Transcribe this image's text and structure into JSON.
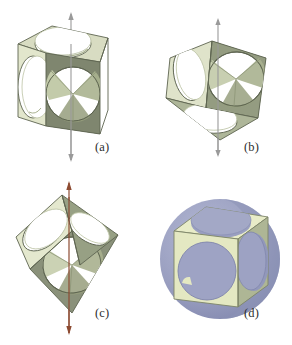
{
  "figure": {
    "caption_style": "lettered-panels",
    "background": "#ffffff",
    "panel_count": 4
  },
  "palette": {
    "face_top_light": "#d8dcc2",
    "face_left_light": "#e2e6cc",
    "face_front_dark": "#7f866f",
    "face_side_mid": "#9aa287",
    "interior_shadow": "#6e7561",
    "interior_light": "#c9cfb2",
    "edge_line": "#5d6450",
    "hole_white": "#ffffff",
    "axis_gray": "#9a9a9a",
    "axis_red": "#8d4b32",
    "sphere_blue": "#9a9fc0",
    "sphere_blue_dark": "#8086ad",
    "sphere_blue_light": "#aeb3cd",
    "label_text": "#2d2d2d"
  },
  "panels": [
    {
      "id": "a",
      "label": "(a)",
      "object": "cube-with-circular-holes",
      "orientation": "face-on / upright cube, standard three-quarter view",
      "axis": {
        "present": true,
        "type": "4-fold rotation axis",
        "color": "#9a9a9a",
        "direction": "vertical",
        "through": "centers of top and bottom faces",
        "arrows": "both-ends"
      },
      "visible_faces": [
        "top",
        "left",
        "front"
      ],
      "holes_visible": 4,
      "sphere_visible": false
    },
    {
      "id": "b",
      "label": "(b)",
      "object": "cube-with-circular-holes",
      "orientation": "tilted, rotated about a face axis",
      "axis": {
        "present": true,
        "type": "2-fold rotation axis",
        "color": "#9a9a9a",
        "direction": "vertical",
        "through": "midpoints of opposite edges",
        "arrows": "both-ends"
      },
      "visible_faces": [
        "top",
        "left",
        "front"
      ],
      "holes_visible": 4,
      "sphere_visible": false
    },
    {
      "id": "c",
      "label": "(c)",
      "object": "cube-with-circular-holes",
      "orientation": "standing on a vertex, diamond silhouette",
      "axis": {
        "present": true,
        "type": "3-fold rotation axis",
        "color": "#8d4b32",
        "direction": "vertical",
        "through": "opposite body-diagonal vertices",
        "arrows": "both-ends"
      },
      "visible_faces": [
        "upper-left",
        "upper-right",
        "lower-front"
      ],
      "holes_visible": 4,
      "sphere_visible": false
    },
    {
      "id": "d",
      "label": "(d)",
      "object": "cube-with-circular-holes-and-inscribed-sphere",
      "orientation": "upright cube, face-on front view",
      "axis": {
        "present": false,
        "type": "",
        "color": "",
        "direction": "",
        "through": "",
        "arrows": "none"
      },
      "visible_faces": [
        "top",
        "front",
        "right"
      ],
      "holes_visible": 3,
      "sphere_visible": true,
      "sphere_color": "#9a9fc0",
      "sphere_note": "sphere larger than the cube, bulging out through every circular hole"
    }
  ]
}
